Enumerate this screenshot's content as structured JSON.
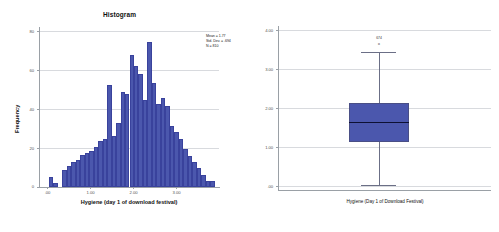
{
  "histogram": {
    "title": "Histogram",
    "ylabel": "Frequency",
    "xlabel": "Hygiene (day 1 of download festival)",
    "yticks": [
      "80",
      "60",
      "40",
      "20",
      "0"
    ],
    "xticks": [
      ".00",
      "1.00",
      "2.00",
      "3.00"
    ],
    "stats": {
      "mean": "Mean = 1.77",
      "std": "Std. Dev. = .694",
      "n": "N = 810"
    }
  },
  "boxplot": {
    "yticks": [
      "4.00",
      "3.00",
      "2.00",
      "1.00",
      ".00"
    ],
    "xlabel": "Hygiene (Day 1 of Download Festival)",
    "outlier_label": "674",
    "outlier_mark": "o"
  },
  "colors": {
    "bar_fill": "#4b57ad",
    "bar_edge": "#39429c",
    "grid": "#d8dade",
    "axis": "#9aa0a6",
    "median": "#0d1033"
  },
  "chart_data": [
    {
      "type": "bar",
      "title": "Histogram",
      "xlabel": "Hygiene (day 1 of download festival)",
      "ylabel": "Frequency",
      "xlim": [
        -0.2,
        3.8
      ],
      "ylim": [
        0,
        85
      ],
      "grid": true,
      "legend": "none",
      "annotations": [
        "Mean = 1.77",
        "Std. Dev. = .694",
        "N = 810"
      ],
      "bin_width": 0.1,
      "bin_centers": [
        0.05,
        0.15,
        0.25,
        0.35,
        0.45,
        0.55,
        0.65,
        0.75,
        0.85,
        0.95,
        1.05,
        1.15,
        1.25,
        1.35,
        1.45,
        1.55,
        1.65,
        1.75,
        1.85,
        1.95,
        2.05,
        2.15,
        2.25,
        2.35,
        2.45,
        2.55,
        2.65,
        2.75,
        2.85,
        2.95,
        3.05,
        3.15,
        3.25,
        3.35,
        3.45,
        3.55,
        3.65
      ],
      "values": [
        5,
        2,
        0,
        9,
        11,
        13,
        14,
        17,
        18,
        19,
        21,
        24,
        25,
        54,
        27,
        34,
        50,
        49,
        70,
        64,
        60,
        46,
        77,
        55,
        44,
        47,
        43,
        32,
        29,
        25,
        20,
        16,
        13,
        10,
        6,
        3,
        3
      ],
      "categories": [
        ".00",
        "1.00",
        "2.00",
        "3.00"
      ]
    },
    {
      "type": "box",
      "xlabel": "Hygiene (Day 1 of Download Festival)",
      "ylim": [
        0,
        4
      ],
      "grid": true,
      "categories": [
        "Hygiene (Day 1 of Download Festival)"
      ],
      "box": {
        "q1": 1.44,
        "median": 1.79,
        "q3": 2.21,
        "whisker_low": 0.02,
        "whisker_high": 3.41
      },
      "outliers": [
        {
          "label": "674",
          "value": 3.55
        }
      ],
      "yticks": [
        0,
        1,
        2,
        3,
        4
      ]
    }
  ]
}
